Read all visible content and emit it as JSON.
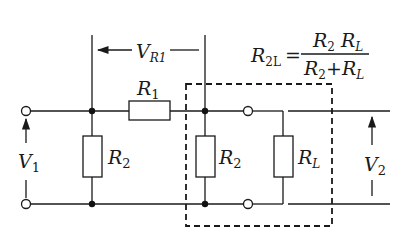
{
  "diagram": {
    "type": "voltage divider with loaded output",
    "labels": {
      "v_r1": {
        "main": "V",
        "sub": "R1"
      },
      "r1": {
        "main": "R",
        "sub": "1"
      },
      "r2_left": {
        "main": "R",
        "sub": "2"
      },
      "r2_right": {
        "main": "R",
        "sub": "2"
      },
      "rl": {
        "main": "R",
        "sub": "L"
      },
      "v1": {
        "main": "V",
        "sub": "1"
      },
      "v2": {
        "main": "V",
        "sub": "2"
      }
    },
    "formula": {
      "lhs_main": "R",
      "lhs_sub": "2L",
      "equals": "=",
      "numerator": {
        "a_main": "R",
        "a_sub": "2",
        "b_main": "R",
        "b_sub": "L"
      },
      "denominator": {
        "a_main": "R",
        "a_sub": "2",
        "plus": "+",
        "b_main": "R",
        "b_sub": "L"
      }
    },
    "colors": {
      "ink": "#1a1a1a",
      "background": "#ffffff"
    }
  }
}
